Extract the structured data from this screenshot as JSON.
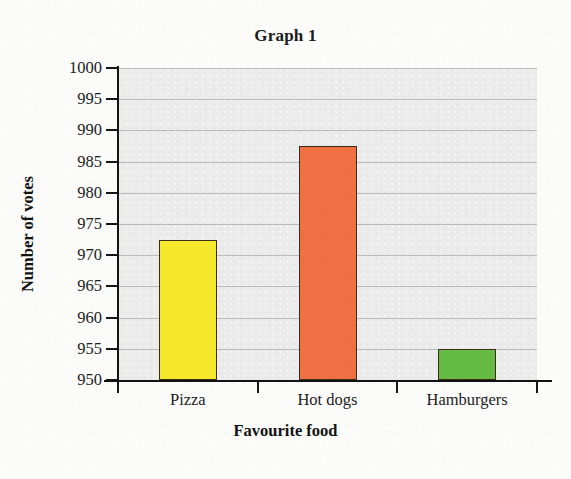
{
  "chart_data": {
    "type": "bar",
    "title": "Graph 1",
    "xlabel": "Favourite food",
    "ylabel": "Number of votes",
    "categories": [
      "Pizza",
      "Hot dogs",
      "Hamburgers"
    ],
    "values": [
      972.5,
      987.5,
      955
    ],
    "ylim": [
      950,
      1000
    ],
    "ytick_step": 5,
    "yticks": [
      1000,
      995,
      990,
      985,
      980,
      975,
      970,
      965,
      960,
      955,
      950
    ],
    "grid": true,
    "legend": false,
    "bar_colors": [
      "#F5E82A",
      "#EE7043",
      "#66BB44"
    ],
    "bar_edge_color": "#3A2D18",
    "plot_background": "#EBEBEB",
    "page_background": "#FBFBF9",
    "axis_color": "#121212",
    "gridline_color": "#9C9C9C",
    "note": "Truncated y-axis starting at 950 exaggerates differences between bars"
  }
}
